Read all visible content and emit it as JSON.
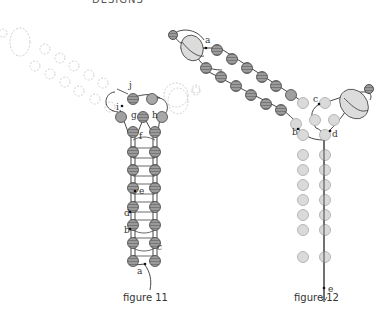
{
  "header_fragment": "DESIGNS",
  "figures": [
    {
      "id": "figure-11",
      "caption": "figure 11",
      "labels": [
        "a",
        "b",
        "c",
        "d",
        "e",
        "f",
        "g",
        "h",
        "i",
        "j"
      ]
    },
    {
      "id": "figure-12",
      "caption": "figure 12",
      "labels": [
        "a",
        "b",
        "c",
        "d",
        "e"
      ]
    }
  ],
  "colors": {
    "active_bead_fill": "#8f8f8f",
    "light_bead_fill": "#d8d8d8",
    "dashed_bead_stroke": "#c8c8c8",
    "thread": "#333333"
  }
}
